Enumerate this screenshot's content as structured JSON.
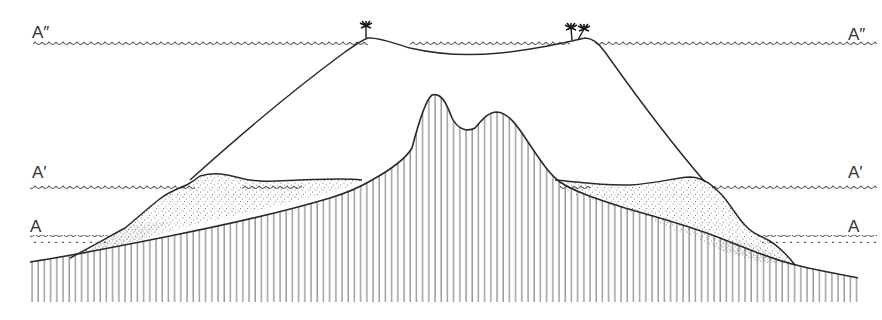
{
  "diagram": {
    "type": "geological-cross-section",
    "colors": {
      "ink": "#2a2a2a",
      "water_line": "#555555",
      "hatch": "#6e6e6e",
      "stipple": "#444444",
      "background": "#ffffff"
    },
    "sea_levels": [
      {
        "id": "A2",
        "label": "A″",
        "y": 43
      },
      {
        "id": "A1",
        "label": "A′",
        "y": 183
      },
      {
        "id": "A0",
        "label": "A",
        "y": 237
      }
    ],
    "labels": {
      "a2_left": "A″",
      "a2_right": "A″",
      "a1_left": "A′",
      "a1_right": "A′",
      "a0_left": "A",
      "a0_right": "A"
    },
    "features": [
      {
        "name": "volcanic-island-core",
        "fill": "vertical-hatch"
      },
      {
        "name": "fringing-reef",
        "fill": "stipple"
      },
      {
        "name": "atoll-outline",
        "fill": "none"
      },
      {
        "name": "palm-trees",
        "count": 3
      }
    ]
  }
}
